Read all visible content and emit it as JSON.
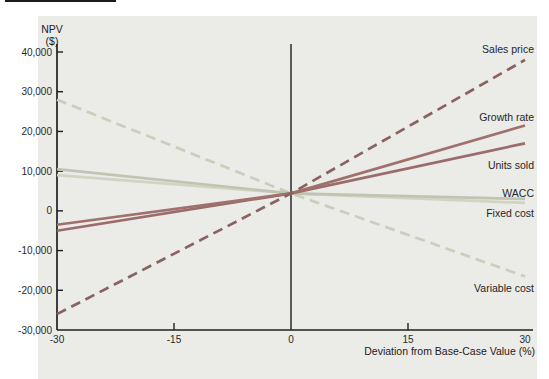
{
  "chart_data": {
    "type": "line",
    "ylabel": "NPV ($)",
    "ylabel_lines": [
      "NPV",
      "($)"
    ],
    "xlabel": "Deviation from Base-Case Value (%)",
    "xlim": [
      -30,
      30
    ],
    "ylim": [
      -30000,
      40000
    ],
    "x": [
      -30,
      0,
      30
    ],
    "x_ticks": [
      -30,
      -15,
      0,
      15,
      30
    ],
    "x_tick_labels": [
      "-30",
      "-15",
      "0",
      "15",
      "30"
    ],
    "y_ticks": [
      40000,
      30000,
      20000,
      10000,
      0,
      -10000,
      -20000,
      -30000
    ],
    "y_tick_labels": [
      "40,000",
      "30,000",
      "20,000",
      "10,000",
      "0",
      "-10,000",
      "-20,000",
      "-30,000"
    ],
    "base_case_npv": 4400,
    "grid": false,
    "legend_position": "line-end-right",
    "axis_color": "#1f1f1f",
    "panel_color": "#ebebe8",
    "series": [
      {
        "name": "Sales price",
        "values": [
          -26000,
          4400,
          38000
        ],
        "style": "dashed",
        "color": "#8a6260",
        "label_dy": -10
      },
      {
        "name": "Growth rate",
        "values": [
          -3500,
          4400,
          21500
        ],
        "style": "solid",
        "color": "#a0706c",
        "label_dy": -8
      },
      {
        "name": "Units sold",
        "values": [
          -5000,
          4400,
          17000
        ],
        "style": "solid",
        "color": "#9a6d6a",
        "label_dy": 22
      },
      {
        "name": "WACC",
        "values": [
          10500,
          4400,
          3000
        ],
        "style": "solid",
        "color": "#bfc5b0",
        "label_dy": -5
      },
      {
        "name": "Fixed cost",
        "values": [
          9000,
          4400,
          2000
        ],
        "style": "solid",
        "color": "#d2d4c2",
        "label_dy": 11
      },
      {
        "name": "Variable cost",
        "values": [
          28000,
          4400,
          -16500
        ],
        "style": "dashed",
        "color": "#c9cfba",
        "label_dy": 12
      }
    ]
  }
}
